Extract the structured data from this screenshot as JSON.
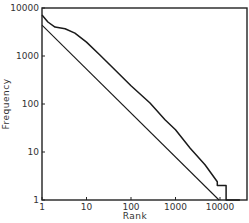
{
  "chart_data": {
    "type": "line",
    "title": "",
    "xlabel": "Rank",
    "ylabel": "Frequency",
    "xscale": "log",
    "yscale": "log",
    "xlim": [
      1,
      30000
    ],
    "ylim": [
      1,
      10000
    ],
    "x_ticks": [
      1,
      10,
      100,
      1000,
      10000
    ],
    "x_tick_labels": [
      "1",
      "10",
      "100",
      "1000",
      "10000"
    ],
    "y_ticks": [
      1,
      10,
      100,
      1000,
      10000
    ],
    "y_tick_labels": [
      "1",
      "10",
      "100",
      "1000",
      "10000"
    ],
    "grid": false,
    "legend": null,
    "series": [
      {
        "name": "observed",
        "points": [
          [
            1,
            7100
          ],
          [
            1.36,
            5100
          ],
          [
            1.96,
            4000
          ],
          [
            3.3,
            3700
          ],
          [
            5.5,
            3000
          ],
          [
            10,
            1950
          ],
          [
            20,
            1050
          ],
          [
            44,
            510
          ],
          [
            100,
            240
          ],
          [
            267,
            105
          ],
          [
            580,
            47
          ],
          [
            1000,
            29
          ],
          [
            2140,
            12
          ],
          [
            4600,
            5.4
          ],
          [
            8700,
            2.4
          ],
          [
            8700,
            2
          ],
          [
            13700,
            2
          ],
          [
            13700,
            1
          ],
          [
            28000,
            1
          ]
        ]
      },
      {
        "name": "reference-line",
        "points": [
          [
            1,
            4400
          ],
          [
            9500,
            1
          ]
        ]
      }
    ]
  }
}
